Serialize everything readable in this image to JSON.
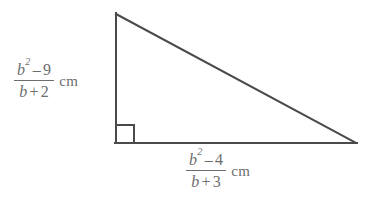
{
  "figure": {
    "background_color": "#ffffff",
    "stroke_color": "#4a4a4a",
    "text_color": "#6d6d6d",
    "stroke_width": 2,
    "shape": {
      "type": "right-triangle",
      "vertices": {
        "apex": [
          116,
          14
        ],
        "right_angle": [
          116,
          143
        ],
        "right": [
          356,
          143
        ]
      },
      "right_angle_marker": {
        "x": 116,
        "y": 125,
        "size": 18
      }
    }
  },
  "labels": {
    "vertical_side": {
      "name": "vertical-side-label",
      "numerator": {
        "variable": "b",
        "exponent": "2",
        "operator": "–",
        "constant": "9"
      },
      "denominator": {
        "variable": "b",
        "operator": "+",
        "constant": "2"
      },
      "unit": "cm",
      "plain_text": "(b² – 9)/(b + 2) cm"
    },
    "horizontal_side": {
      "name": "horizontal-side-label",
      "numerator": {
        "variable": "b",
        "exponent": "2",
        "operator": "–",
        "constant": "4"
      },
      "denominator": {
        "variable": "b",
        "operator": "+",
        "constant": "3"
      },
      "unit": "cm",
      "plain_text": "(b² – 4)/(b + 3) cm"
    }
  }
}
